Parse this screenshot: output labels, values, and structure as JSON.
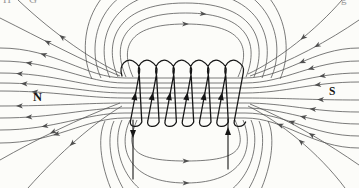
{
  "figure": {
    "type": "physics-diagram",
    "labels": {
      "north": "N",
      "south": "S"
    },
    "page_crop_fragments": {
      "top_left_a": "H",
      "top_left_b": "G",
      "top_right": "g"
    },
    "colors": {
      "background": "#fcfcf9",
      "field_line": "#4f4f4f",
      "coil": "#161616",
      "label": "#141414",
      "fragment": "#9a9a9a"
    },
    "counts": {
      "coil_windings": 7,
      "axis_field_lines": 9,
      "top_loop_lines": 6,
      "bottom_loop_lines": 5
    },
    "current_arrows": {
      "left_lead": "down",
      "right_lead": "up",
      "coil_front_strands": "up"
    },
    "field_direction": {
      "left_of_coil": "outward away from N pole",
      "right_of_coil": "inward toward S pole",
      "top_loops": "left to right",
      "bottom_loops": "left to right"
    }
  }
}
